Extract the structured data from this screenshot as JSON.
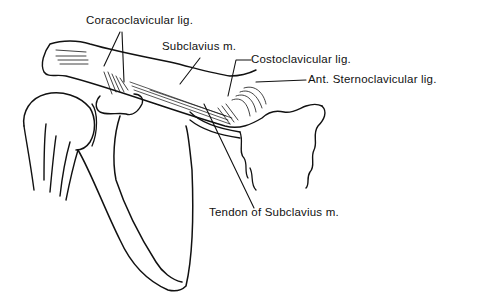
{
  "diagram": {
    "labels": {
      "coracoclavicular": "Coracoclavicular  lig.",
      "subclavius": "Subclavius m.",
      "costoclavicular": "Costoclavicular  lig.",
      "ant_sternoclavicular": "Ant.  Sternoclavicular  lig.",
      "tendon_subclavius": "Tendon  of  Subclavius  m."
    },
    "colors": {
      "ink": "#111111",
      "background": "#ffffff"
    }
  }
}
